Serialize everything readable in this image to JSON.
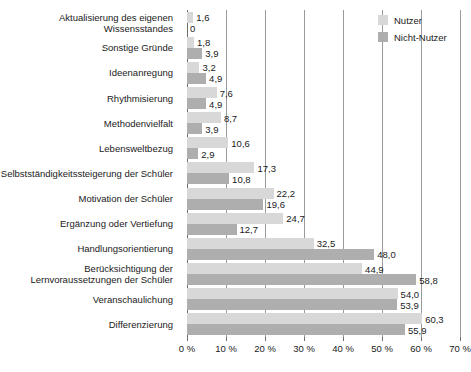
{
  "chart_data": {
    "type": "bar",
    "orientation": "horizontal",
    "title": "",
    "xlabel": "",
    "ylabel": "",
    "xlim": [
      0,
      70
    ],
    "grid": true,
    "legend_position": "top-right",
    "xticks": [
      "0 %",
      "10 %",
      "20 %",
      "30 %",
      "40 %",
      "50 %",
      "60 %",
      "70 %"
    ],
    "xtick_values": [
      0,
      10,
      20,
      30,
      40,
      50,
      60,
      70
    ],
    "categories": [
      "Aktualisierung des eigenen\nWissensstandes",
      "Sonstige Gründe",
      "Ideenanregung",
      "Rhythmisierung",
      "Methodenvielfalt",
      "Lebensweltbezug",
      "Selbstständigkeitssteigerung der Schüler",
      "Motivation der Schüler",
      "Ergänzung oder Vertiefung",
      "Handlungsorientierung",
      "Berücksichtigung der\nLernvoraussetzungen der Schüler",
      "Veranschaulichung",
      "Differenzierung"
    ],
    "series": [
      {
        "name": "Nutzer",
        "color": "#d8d8d8",
        "values": [
          1.6,
          1.8,
          3.2,
          7.6,
          8.7,
          10.6,
          17.3,
          22.2,
          24.7,
          32.5,
          44.9,
          54.0,
          60.3
        ],
        "labels": [
          "1,6",
          "1,8",
          "3,2",
          "7,6",
          "8,7",
          "10,6",
          "17,3",
          "22,2",
          "24,7",
          "32,5",
          "44,9",
          "54,0",
          "60,3"
        ]
      },
      {
        "name": "Nicht-Nutzer",
        "color": "#aeaeae",
        "values": [
          0,
          3.9,
          4.9,
          4.9,
          3.9,
          2.9,
          10.8,
          19.6,
          12.7,
          48.0,
          58.8,
          53.9,
          55.9
        ],
        "labels": [
          "0",
          "3,9",
          "4,9",
          "4,9",
          "3,9",
          "2,9",
          "10,8",
          "19,6",
          "12,7",
          "48,0",
          "58,8",
          "53,9",
          "55,9"
        ]
      }
    ]
  },
  "legend": {
    "items": [
      {
        "label": "Nutzer"
      },
      {
        "label": "Nicht-Nutzer"
      }
    ]
  }
}
